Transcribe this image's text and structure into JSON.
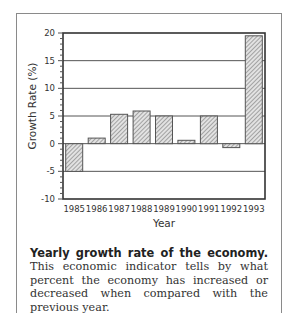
{
  "chart_data": {
    "type": "bar",
    "title": "",
    "xlabel": "Year",
    "ylabel": "Growth Rate (%)",
    "categories": [
      "1985",
      "1986",
      "1987",
      "1988",
      "1989",
      "1990",
      "1991",
      "1992",
      "1993"
    ],
    "values": [
      -5.0,
      1.0,
      5.3,
      5.9,
      5.0,
      0.6,
      5.0,
      -0.7,
      19.5
    ],
    "ylim": [
      -10,
      20
    ],
    "yticks": [
      -10,
      -5,
      0,
      5,
      10,
      15,
      20
    ],
    "grid": "horizontal at major ticks",
    "legend": null,
    "bar_fill": "hatched gray"
  },
  "caption": {
    "bold": "Yearly growth rate of the economy.",
    "text": " This economic indicator tells by what percent the economy has increased or decreased when compared with the previous year."
  },
  "colors": {
    "axis": "#333333",
    "grid": "#555555",
    "bar_fill": "#c8c8c8",
    "frame": "#8a8a8a"
  }
}
